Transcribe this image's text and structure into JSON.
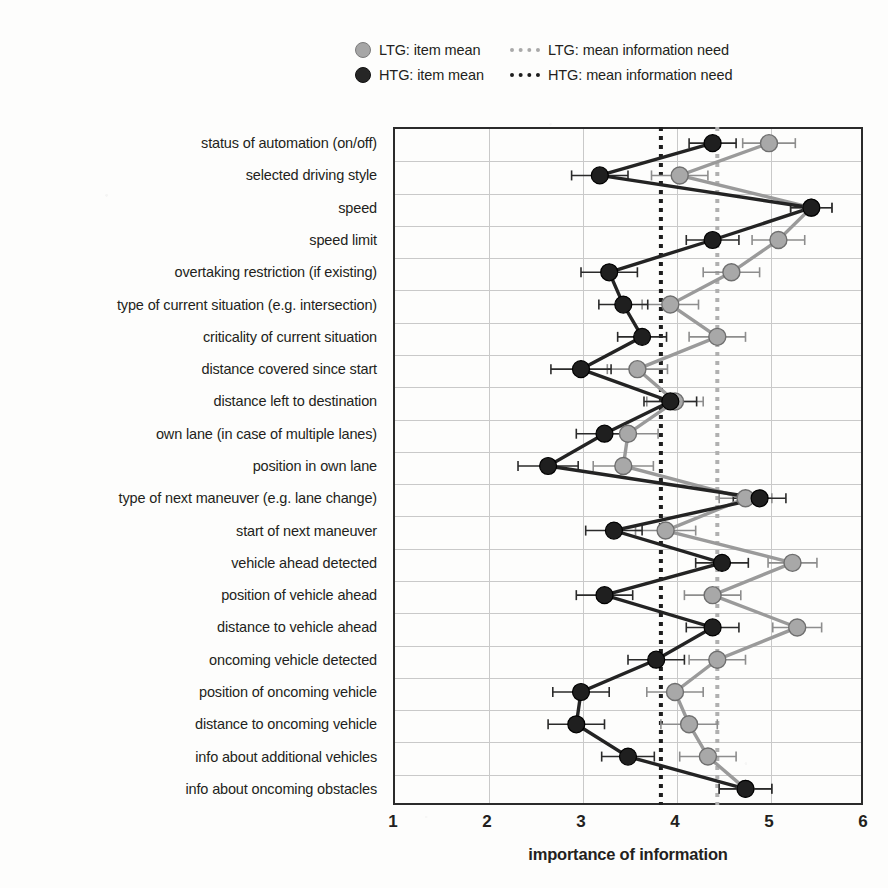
{
  "chart_data": {
    "type": "line",
    "orientation": "horizontal",
    "title": "",
    "xlabel": "importance of information",
    "ylabel": "",
    "xlim": [
      1,
      6
    ],
    "xticks": [
      "1",
      "2",
      "3",
      "4",
      "5",
      "6"
    ],
    "grid": true,
    "legend_position": "top",
    "categories": [
      "status of automation (on/off)",
      "selected driving style",
      "speed",
      "speed limit",
      "overtaking restriction (if existing)",
      "type of current situation (e.g. intersection)",
      "criticality of current situation",
      "distance covered since start",
      "distance left to destination",
      "own lane (in case of multiple lanes)",
      "position in own lane",
      "type of next maneuver (e.g. lane change)",
      "start of next maneuver",
      "vehicle ahead detected",
      "position of vehicle ahead",
      "distance to vehicle ahead",
      "oncoming vehicle detected",
      "position of oncoming vehicle",
      "distance to oncoming vehicle",
      "info about additional vehicles",
      "info about oncoming obstacles"
    ],
    "series": [
      {
        "name": "LTG: item mean",
        "color": "#a6a6a6",
        "values": [
          5.0,
          4.05,
          5.45,
          5.1,
          4.6,
          3.95,
          4.45,
          3.6,
          4.0,
          3.5,
          3.45,
          4.75,
          3.9,
          5.25,
          4.4,
          5.3,
          4.45,
          4.0,
          4.15,
          4.35,
          4.75
        ],
        "errors": [
          0.28,
          0.3,
          0.22,
          0.28,
          0.3,
          0.3,
          0.3,
          0.32,
          0.3,
          0.32,
          0.32,
          0.28,
          0.32,
          0.26,
          0.3,
          0.26,
          0.3,
          0.3,
          0.3,
          0.3,
          0.28
        ]
      },
      {
        "name": "HTG: item mean",
        "color": "#262626",
        "values": [
          4.4,
          3.2,
          5.45,
          4.4,
          3.3,
          3.45,
          3.65,
          3.0,
          3.95,
          3.25,
          2.65,
          4.9,
          3.35,
          4.5,
          3.25,
          4.4,
          3.8,
          3.0,
          2.95,
          3.5,
          4.75
        ],
        "errors": [
          0.25,
          0.3,
          0.22,
          0.28,
          0.3,
          0.26,
          0.26,
          0.32,
          0.28,
          0.3,
          0.32,
          0.28,
          0.3,
          0.28,
          0.3,
          0.28,
          0.3,
          0.3,
          0.3,
          0.28,
          0.28
        ]
      }
    ],
    "reference_lines": [
      {
        "name": "LTG: mean information need",
        "value": 4.45,
        "color": "#b0b0b0",
        "style": "dotted"
      },
      {
        "name": "HTG: mean information need",
        "value": 3.85,
        "color": "#1d1d1d",
        "style": "dotted"
      }
    ]
  },
  "legend": {
    "entries": [
      {
        "label": "LTG: item mean",
        "marker": "circle-light",
        "kind": "marker",
        "group": "ltg"
      },
      {
        "label": "LTG: mean information need",
        "marker": "dotted-line-light",
        "kind": "line",
        "group": "ltg"
      },
      {
        "label": "HTG: item mean",
        "marker": "circle-dark",
        "kind": "marker",
        "group": "htg"
      },
      {
        "label": "HTG: mean information need",
        "marker": "dotted-line-dark",
        "kind": "line",
        "group": "htg"
      }
    ]
  }
}
